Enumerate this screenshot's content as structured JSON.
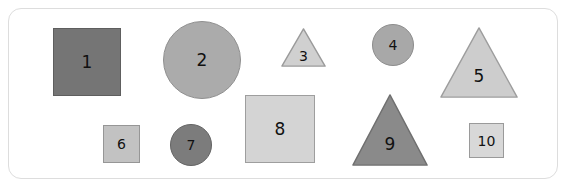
{
  "canvas": {
    "width": 568,
    "height": 189,
    "background_color": "#ffffff"
  },
  "card": {
    "name": "shape-card-frame",
    "background_color": "#ffffff",
    "border_color": "#dddddd",
    "border_radius": 13,
    "x": 8,
    "y": 8,
    "width": 550,
    "height": 171
  },
  "shapes": [
    {
      "id": 1,
      "label": "1",
      "kind": "square",
      "x": 53,
      "y": 28,
      "width": 68,
      "height": 68,
      "fill": "#757575",
      "stroke": "#5e5e5e",
      "font_size": 17
    },
    {
      "id": 2,
      "label": "2",
      "kind": "circle",
      "x": 163,
      "y": 21,
      "width": 78,
      "height": 78,
      "fill": "#ababab",
      "stroke": "#8f8f8f",
      "font_size": 17
    },
    {
      "id": 3,
      "label": "3",
      "kind": "triangle",
      "x": 281,
      "y": 28,
      "width": 45,
      "height": 39,
      "fill": "#d0d0d0",
      "stroke": "#9a9a9a",
      "font_size": 14,
      "label_offset": 0.55
    },
    {
      "id": 4,
      "label": "4",
      "kind": "circle",
      "x": 372,
      "y": 24,
      "width": 42,
      "height": 42,
      "fill": "#a8a8a8",
      "stroke": "#8c8c8c",
      "font_size": 14
    },
    {
      "id": 5,
      "label": "5",
      "kind": "triangle",
      "x": 440,
      "y": 27,
      "width": 78,
      "height": 71,
      "fill": "#cdcdcd",
      "stroke": "#9d9d9d",
      "font_size": 17,
      "label_offset": 0.58
    },
    {
      "id": 6,
      "label": "6",
      "kind": "square",
      "x": 103,
      "y": 125,
      "width": 37,
      "height": 38,
      "fill": "#c2c2c2",
      "stroke": "#969696",
      "font_size": 14
    },
    {
      "id": 7,
      "label": "7",
      "kind": "circle",
      "x": 170,
      "y": 124,
      "width": 42,
      "height": 42,
      "fill": "#7c7c7c",
      "stroke": "#636363",
      "font_size": 14
    },
    {
      "id": 8,
      "label": "8",
      "kind": "square",
      "x": 245,
      "y": 95,
      "width": 70,
      "height": 68,
      "fill": "#d4d4d4",
      "stroke": "#9e9e9e",
      "font_size": 17
    },
    {
      "id": 9,
      "label": "9",
      "kind": "triangle",
      "x": 352,
      "y": 94,
      "width": 76,
      "height": 72,
      "fill": "#8a8a8a",
      "stroke": "#6f6f6f",
      "font_size": 17,
      "label_offset": 0.58
    },
    {
      "id": 10,
      "label": "10",
      "kind": "square",
      "x": 469,
      "y": 123,
      "width": 35,
      "height": 35,
      "fill": "#d8d8d8",
      "stroke": "#9a9a9a",
      "font_size": 14
    }
  ]
}
